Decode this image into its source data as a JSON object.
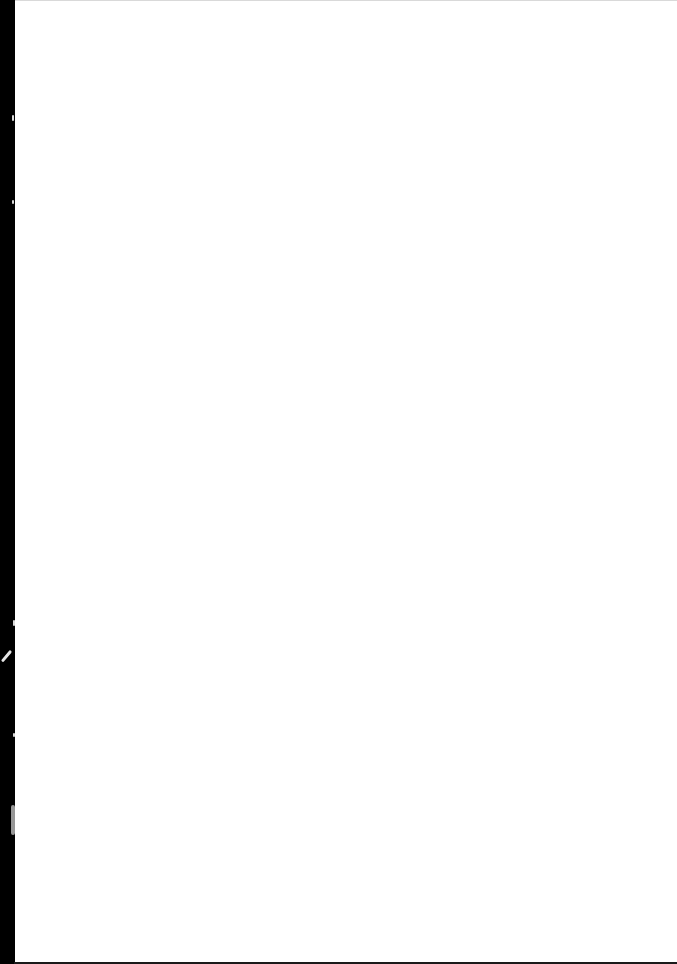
{
  "document": {
    "type": "scanned-page",
    "content": "",
    "is_blank": true,
    "colors": {
      "page_background": "#ffffff",
      "binding_edge": "#000000",
      "top_border": "#d9d9d9",
      "bottom_border": "#1a1a1a"
    },
    "artifacts": [
      {
        "kind": "binding-strip",
        "side": "left"
      },
      {
        "kind": "scratch",
        "side": "left"
      },
      {
        "kind": "light-mark",
        "side": "left"
      }
    ]
  }
}
